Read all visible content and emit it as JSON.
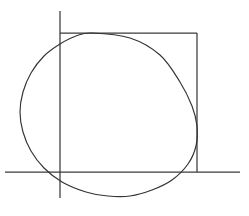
{
  "figure": {
    "title": "Convex closed curve inscribed against axis lines and a bounding corner",
    "background_color": "#ffffff",
    "line_color": "#3b3b3b",
    "curve_color": "#333333",
    "canvas": {
      "width": 249,
      "height": 216
    }
  },
  "chart_data": {
    "type": "line",
    "xlabel": "",
    "ylabel": "",
    "xlim": [
      0,
      249
    ],
    "ylim": [
      0,
      216
    ],
    "grid": false,
    "legend": null,
    "annotations": [],
    "series": [
      {
        "name": "vertical-axis-line",
        "kind": "segment",
        "points": [
          [
            60,
            11
          ],
          [
            60,
            198
          ]
        ]
      },
      {
        "name": "horizontal-axis-line",
        "kind": "segment",
        "points": [
          [
            5,
            172
          ],
          [
            240,
            172
          ]
        ]
      },
      {
        "name": "box-top-edge",
        "kind": "segment",
        "points": [
          [
            60,
            33
          ],
          [
            197,
            33
          ]
        ]
      },
      {
        "name": "box-right-edge",
        "kind": "segment",
        "points": [
          [
            197,
            33
          ],
          [
            197,
            172
          ]
        ]
      },
      {
        "name": "closed-convex-curve",
        "kind": "closed-curve",
        "points": [
          [
            92,
            33
          ],
          [
            130,
            38
          ],
          [
            160,
            55
          ],
          [
            180,
            82
          ],
          [
            192,
            106
          ],
          [
            197,
            126
          ],
          [
            196,
            146
          ],
          [
            188,
            164
          ],
          [
            172,
            180
          ],
          [
            152,
            190
          ],
          [
            130,
            196
          ],
          [
            108,
            196
          ],
          [
            86,
            192
          ],
          [
            62,
            182
          ],
          [
            44,
            168
          ],
          [
            31,
            151
          ],
          [
            23,
            132
          ],
          [
            20,
            112
          ],
          [
            23,
            92
          ],
          [
            31,
            73
          ],
          [
            44,
            56
          ],
          [
            60,
            44
          ],
          [
            76,
            36
          ],
          [
            92,
            33
          ]
        ],
        "tangency": {
          "top": [
            92,
            33
          ],
          "right": [
            197,
            126
          ]
        },
        "extrema": {
          "leftmost": [
            20,
            112
          ],
          "bottom": [
            130,
            196
          ]
        }
      }
    ]
  }
}
